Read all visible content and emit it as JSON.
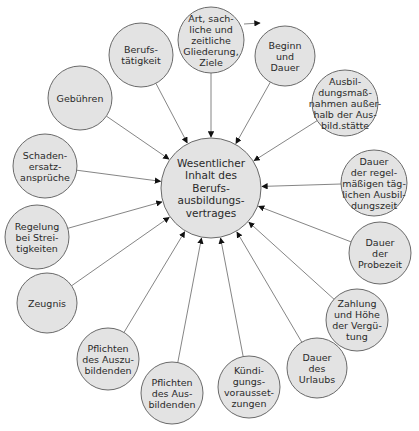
{
  "diagram": {
    "type": "radial-concept-map",
    "center": {
      "id": "center",
      "x": 211,
      "y": 188,
      "r": 50,
      "lines": [
        "Wesentlicher",
        "Inhalt des",
        "Berufs-",
        "ausbildungs-",
        "vertrages"
      ]
    },
    "nodes": [
      {
        "id": "art-gliederung-ziele",
        "x": 211,
        "y": 40,
        "r": 33,
        "lines": [
          "Art, sach-",
          "liche und",
          "zeitliche",
          "Gliederung,",
          "Ziele"
        ]
      },
      {
        "id": "beginn-dauer",
        "x": 285,
        "y": 56,
        "r": 30,
        "lines": [
          "Beginn",
          "und",
          "Dauer"
        ]
      },
      {
        "id": "ausbildungsmassnahmen",
        "x": 345,
        "y": 103,
        "r": 33,
        "lines": [
          "Ausbil-",
          "dungsmaß-",
          "nahmen außer-",
          "halb der Aus-",
          "bild.stätte"
        ]
      },
      {
        "id": "taegliche-ausbildungszeit",
        "x": 374,
        "y": 183,
        "r": 33,
        "lines": [
          "Dauer",
          "der regel-",
          "mäßigen täg-",
          "lichen Ausbil-",
          "dungszeit"
        ]
      },
      {
        "id": "probezeit",
        "x": 380,
        "y": 253,
        "r": 31,
        "lines": [
          "Dauer",
          "der",
          "Probezeit"
        ]
      },
      {
        "id": "verguetung",
        "x": 357,
        "y": 320,
        "r": 31,
        "lines": [
          "Zahlung",
          "und Höhe",
          "der Vergü-",
          "tung"
        ]
      },
      {
        "id": "urlaub",
        "x": 317,
        "y": 368,
        "r": 30,
        "lines": [
          "Dauer",
          "des",
          "Urlaubs"
        ]
      },
      {
        "id": "kuendigung",
        "x": 249,
        "y": 387,
        "r": 31,
        "lines": [
          "Kündi-",
          "gungs-",
          "vorausset-",
          "zungen"
        ]
      },
      {
        "id": "pflichten-ausbildende",
        "x": 172,
        "y": 393,
        "r": 31,
        "lines": [
          "Pflichten",
          "des Aus-",
          "bildenden"
        ]
      },
      {
        "id": "pflichten-auszubildende",
        "x": 108,
        "y": 359,
        "r": 31,
        "lines": [
          "Pflichten",
          "des Auszu-",
          "bildenden"
        ]
      },
      {
        "id": "zeugnis",
        "x": 47,
        "y": 303,
        "r": 30,
        "lines": [
          "Zeugnis"
        ]
      },
      {
        "id": "streitigkeiten",
        "x": 37,
        "y": 237,
        "r": 32,
        "lines": [
          "Regelung",
          "bei Strei-",
          "tigkeiten"
        ]
      },
      {
        "id": "schadenersatz",
        "x": 45,
        "y": 166,
        "r": 32,
        "lines": [
          "Schaden-",
          "ersatz-",
          "ansprüche"
        ]
      },
      {
        "id": "gebuehren",
        "x": 80,
        "y": 98,
        "r": 32,
        "lines": [
          "Gebühren"
        ]
      },
      {
        "id": "berufstaetigkeit",
        "x": 141,
        "y": 55,
        "r": 32,
        "lines": [
          "Berufs-",
          "tätigkeit"
        ]
      }
    ],
    "stray_arrow": {
      "x1": 244,
      "y1": 24,
      "x2": 260,
      "y2": 23
    },
    "colors": {
      "node_fill": "#e3e3e3",
      "node_stroke": "#6a6a6a",
      "edge": "#777777",
      "text": "#2a2a2a",
      "arrowhead": "#111111"
    }
  }
}
